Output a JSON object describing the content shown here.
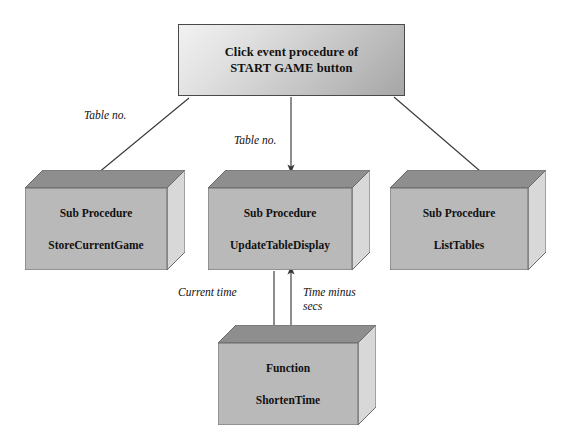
{
  "diagram": {
    "title_box": {
      "name": "click-event-procedure",
      "line1": "Click event procedure of",
      "line2": "START GAME button",
      "fill_start": "#f2f2f2",
      "fill_end": "#a6a6a6",
      "border_color": "#4a4a4a"
    },
    "nodes": [
      {
        "id": "store-current-game",
        "kind": "Sub Procedure",
        "name": "StoreCurrentGame",
        "front_color": "#b9b9b9",
        "top_color": "#8e8e8e",
        "side_color": "#d8d8d8"
      },
      {
        "id": "update-table-display",
        "kind": "Sub Procedure",
        "name": "UpdateTableDisplay",
        "front_color": "#b9b9b9",
        "top_color": "#8e8e8e",
        "side_color": "#d8d8d8"
      },
      {
        "id": "list-tables",
        "kind": "Sub Procedure",
        "name": "ListTables",
        "front_color": "#b9b9b9",
        "top_color": "#8e8e8e",
        "side_color": "#d8d8d8"
      },
      {
        "id": "shorten-time",
        "kind": "Function",
        "name": "ShortenTime",
        "front_color": "#b9b9b9",
        "top_color": "#8e8e8e",
        "side_color": "#d8d8d8"
      }
    ],
    "edge_labels": {
      "left": "Table no.",
      "middle": "Table no.",
      "down": "Current time",
      "up": "Time minus\nsecs"
    },
    "line_color": "#3a3a3a"
  }
}
